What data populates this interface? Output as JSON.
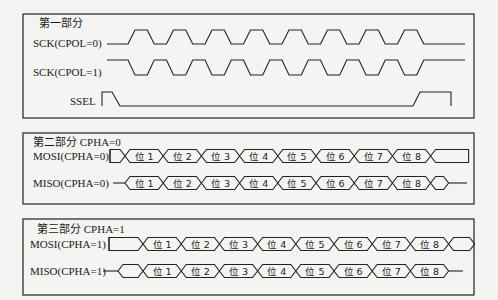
{
  "sections": [
    {
      "title": "第一部分",
      "signals": [
        {
          "label": "SCK(CPOL=0)",
          "type": "clock",
          "idle": "low",
          "cycles": 8
        },
        {
          "label": "SCK(CPOL=1)",
          "type": "clock",
          "idle": "high",
          "cycles": 8
        },
        {
          "label": "SSEL",
          "type": "select",
          "active": "low"
        }
      ]
    },
    {
      "title": "第二部分 CPHA=0",
      "signals": [
        {
          "label": "MOSI(CPHA=0)",
          "type": "bus",
          "bits": [
            "位 1",
            "位 2",
            "位 3",
            "位 4",
            "位 5",
            "位 6",
            "位 7",
            "位 8"
          ]
        },
        {
          "label": "MISO(CPHA=0)",
          "type": "bus",
          "bits": [
            "位 1",
            "位 2",
            "位 3",
            "位 4",
            "位 5",
            "位 6",
            "位 7",
            "位 8"
          ]
        }
      ]
    },
    {
      "title": "第三部分 CPHA=1",
      "signals": [
        {
          "label": "MOSI(CPHA=1)",
          "type": "bus",
          "bits": [
            "位 1",
            "位 2",
            "位 3",
            "位 4",
            "位 5",
            "位 6",
            "位 7",
            "位 8"
          ]
        },
        {
          "label": "MISO(CPHA=1)",
          "type": "bus",
          "bits": [
            "位 1",
            "位 2",
            "位 3",
            "位 4",
            "位 5",
            "位 6",
            "位 7",
            "位 8"
          ]
        }
      ]
    }
  ],
  "colors": {
    "line": "#222222",
    "background": "#f4f4f2"
  }
}
